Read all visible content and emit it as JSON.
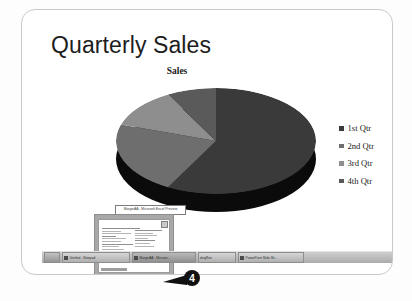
{
  "slide": {
    "title": "Quarterly Sales"
  },
  "chart_data": {
    "type": "pie",
    "title": "Sales",
    "categories": [
      "1st Qtr",
      "2nd Qtr",
      "3rd Qtr",
      "4th Qtr"
    ],
    "values": [
      58,
      22,
      12,
      8
    ],
    "colors": [
      "#3a3a3a",
      "#6e6e6e",
      "#8e8e8e",
      "#5a5a5a"
    ],
    "side_color": "#0b0b0b",
    "legend_position": "right",
    "three_d": true,
    "grid": false,
    "xlabel": "",
    "ylabel": ""
  },
  "legend": {
    "entries": [
      {
        "label": "1st Qtr",
        "color": "#3a3a3a"
      },
      {
        "label": "2nd Qtr",
        "color": "#6e6e6e"
      },
      {
        "label": "3rd Qtr",
        "color": "#8e8e8e"
      },
      {
        "label": "4th Qtr",
        "color": "#5a5a5a"
      }
    ]
  },
  "preview_window": {
    "tooltip": "MarginAA - Microsoft Excel Preview",
    "close_label": "x"
  },
  "taskbar": {
    "start_label": "",
    "items": [
      {
        "label": "Untitled - Notepad"
      },
      {
        "label": "MarginAA - Microso..."
      },
      {
        "label": "dingRun"
      },
      {
        "label": "PowerPoint Slide Sh..."
      }
    ],
    "clock": "3:15 PM"
  },
  "callout": {
    "number": "4"
  }
}
